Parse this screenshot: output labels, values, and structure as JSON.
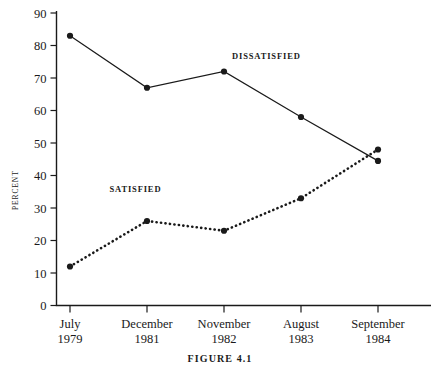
{
  "figure": {
    "caption": "FIGURE 4.1",
    "ylabel": "PERCENT"
  },
  "chart_data": {
    "type": "line",
    "title": "",
    "xlabel": "",
    "ylabel": "PERCENT",
    "ylim": [
      0,
      90
    ],
    "yticks": [
      0,
      10,
      20,
      30,
      40,
      50,
      60,
      70,
      80,
      90
    ],
    "ytick_labels": [
      "0",
      "10",
      "20",
      "30",
      "40",
      "50",
      "60",
      "70",
      "80",
      "90"
    ],
    "grid": false,
    "legend_position": "inline-annotation",
    "categories": [
      "July\n1979",
      "December\n1981",
      "November\n1982",
      "August\n1983",
      "September\n1984"
    ],
    "category_lines": [
      {
        "month": "July",
        "year": "1979"
      },
      {
        "month": "December",
        "year": "1981"
      },
      {
        "month": "November",
        "year": "1982"
      },
      {
        "month": "August",
        "year": "1983"
      },
      {
        "month": "September",
        "year": "1984"
      }
    ],
    "series": [
      {
        "name": "DISSATISFIED",
        "style": "solid",
        "color": "#1a1a1a",
        "values": [
          83,
          67,
          72,
          58,
          44.5
        ]
      },
      {
        "name": "SATISFIED",
        "style": "dotted",
        "color": "#1a1a1a",
        "values": [
          12,
          26,
          23,
          33,
          48
        ]
      }
    ],
    "annotations": [
      {
        "text": "DISSATISFIED",
        "x_index": 2.55,
        "y_value": 76
      },
      {
        "text": "SATISFIED",
        "x_index": 0.85,
        "y_value": 35
      }
    ]
  }
}
